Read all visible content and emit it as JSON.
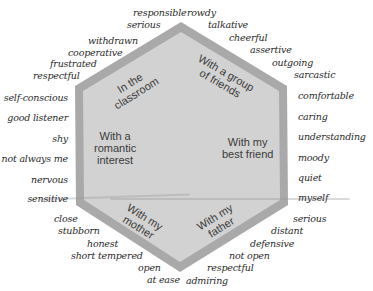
{
  "diagram": {
    "shape": "hexagon",
    "colors": {
      "fill": "#cfcfcf",
      "border": "#a9a9a9",
      "text": "#3a3a3a",
      "words": "#2a2a2a"
    },
    "segments": [
      {
        "id": "classroom",
        "label_line1": "In the",
        "label_line2": "classroom"
      },
      {
        "id": "friends",
        "label_line1": "With a group",
        "label_line2": "of friends"
      },
      {
        "id": "best_friend",
        "label_line1": "With my",
        "label_line2": "best friend"
      },
      {
        "id": "father",
        "label_line1": "With my",
        "label_line2": "father"
      },
      {
        "id": "mother",
        "label_line1": "With my",
        "label_line2": "mother"
      },
      {
        "id": "romantic",
        "label_line1": "With a",
        "label_line2": "romantic",
        "label_line3": "interest"
      }
    ],
    "words": {
      "top_left": [
        "responsible",
        "serious",
        "withdrawn",
        "cooperative",
        "frustrated",
        "respectful"
      ],
      "left": [
        "self-conscious",
        "good listener",
        "shy",
        "not always me",
        "nervous",
        "sensitive"
      ],
      "bottom_left": [
        "close",
        "stubborn",
        "honest",
        "short tempered",
        "open",
        "at ease"
      ],
      "top_right": [
        "rowdy",
        "talkative",
        "cheerful",
        "assertive",
        "outgoing",
        "sarcastic"
      ],
      "right": [
        "comfortable",
        "caring",
        "understanding",
        "moody",
        "quiet",
        "myself"
      ],
      "bottom_right": [
        "serious",
        "distant",
        "defensive",
        "not open",
        "respectful",
        "admiring"
      ]
    }
  }
}
